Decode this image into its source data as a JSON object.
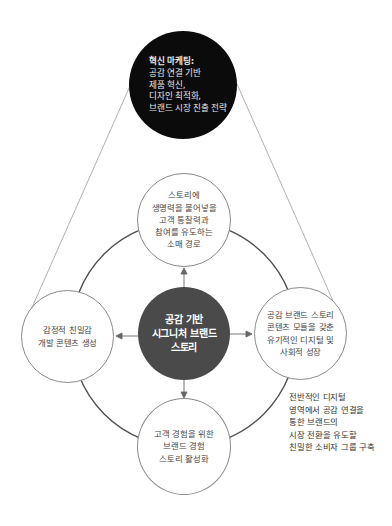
{
  "diagram": {
    "colors": {
      "top_node_fill": "#0b0b0b",
      "center_node_fill": "#4a4a4a",
      "satellite_node_fill": "#ffffff",
      "ring_stroke": "#4f4f4f",
      "connector_stroke": "#9a9a9a",
      "text_dark": "#444444",
      "text_light": "#ffffff"
    },
    "top_node": {
      "title": "혁신 마케팅:",
      "lines": [
        "공감 연결 기반",
        "제품 혁신,",
        "디자인 최적화,",
        "브랜드 시장 진출 전략"
      ]
    },
    "center_node": {
      "lines": [
        "공감 기반",
        "시그니처 브랜드",
        "스토리"
      ]
    },
    "satellites": {
      "top": {
        "lines": [
          "스토리에",
          "생명력을 불어넣을",
          "고객 통찰력과",
          "참여를 유도하는",
          "소매 경로"
        ]
      },
      "left": {
        "lines": [
          "감정적 친밀감",
          "개발 콘텐츠 생성"
        ]
      },
      "right": {
        "lines": [
          "공감 브랜드 스토리",
          "콘텐츠 모듈을 갖춘",
          "유기적인 디지털 및",
          "사회적 성장"
        ]
      },
      "bottom": {
        "lines": [
          "고객 경험을 위한",
          "브랜드 경험",
          "스토리 활성화"
        ]
      }
    },
    "annotation": {
      "lines": [
        "전반적인 디지털",
        "영역에서 공감 연결을",
        "통한 브랜드의",
        "시장 전환을 유도할",
        "친밀한 소비자 그룹 구축"
      ]
    }
  }
}
